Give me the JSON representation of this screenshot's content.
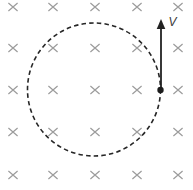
{
  "diagram": {
    "canvas": {
      "width": 193,
      "height": 190,
      "background": "#ffffff"
    },
    "field": {
      "symbol": "×",
      "symbol_name": "field-into-page-x-icon",
      "color": "#9c9c9c",
      "columns_x": [
        13,
        53,
        95,
        137,
        178
      ],
      "rows_y": [
        7,
        48,
        90,
        132,
        175
      ],
      "arm_x": 4.6,
      "arm_y": 4.0,
      "stroke_width": 1.2
    },
    "orbit_circle": {
      "cx": 94,
      "cy": 89.5,
      "r": 66.5,
      "stroke": "#262626",
      "stroke_width": 1.6,
      "dash": "4.5 3.2"
    },
    "particle": {
      "cx": 160.5,
      "cy": 90,
      "r": 3.2,
      "fill": "#1c1c1c"
    },
    "velocity_arrow": {
      "x": 161,
      "y_tail": 88,
      "y_tip": 19,
      "head_length": 10,
      "head_half_width": 4.3,
      "color": "#222222",
      "stroke_width": 1.8
    },
    "velocity_label": {
      "text": "V",
      "x": 168.5,
      "y": 26,
      "color": "#3a3a3a",
      "font_size": 12
    }
  }
}
